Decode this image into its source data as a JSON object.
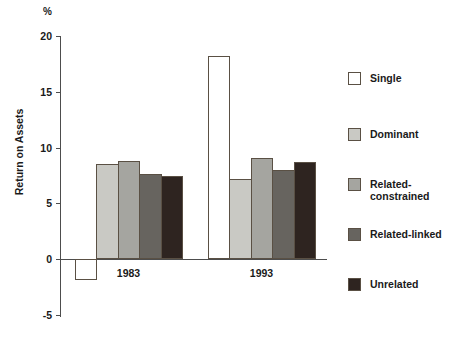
{
  "chart_data": {
    "type": "bar",
    "title": "",
    "subtitle": "",
    "xlabel": "",
    "ylabel": "Return on Assets",
    "unit_label": "%",
    "categories": [
      "1983",
      "1993"
    ],
    "ylim": [
      -5,
      20
    ],
    "yticks": [
      -5,
      0,
      5,
      10,
      15,
      20
    ],
    "ytick_labels": [
      "-5",
      "0",
      "5",
      "10",
      "15",
      "20"
    ],
    "grid": false,
    "legend_position": "right",
    "series": [
      {
        "name": "Single",
        "values": [
          -1.9,
          18.2
        ],
        "color": "#ffffff"
      },
      {
        "name": "Dominant",
        "values": [
          8.5,
          7.2
        ],
        "color": "#c9c9c4"
      },
      {
        "name": "Related-\nconstrained",
        "values": [
          8.8,
          9.1
        ],
        "color": "#a5a5a0"
      },
      {
        "name": "Related-linked",
        "values": [
          7.6,
          8.0
        ],
        "color": "#67645f"
      },
      {
        "name": "Unrelated",
        "values": [
          7.4,
          8.7
        ],
        "color": "#2e2420"
      }
    ]
  },
  "axis": {
    "unit": "%",
    "title": "Return on Assets",
    "ticks": [
      "20",
      "15",
      "10",
      "5",
      "0",
      "-5"
    ]
  },
  "groups": [
    {
      "label": "1983"
    },
    {
      "label": "1993"
    }
  ],
  "legend": {
    "items": [
      {
        "label": "Single"
      },
      {
        "label": "Dominant"
      },
      {
        "label": "Related-\nconstrained"
      },
      {
        "label": "Related-linked"
      },
      {
        "label": "Unrelated"
      }
    ]
  }
}
